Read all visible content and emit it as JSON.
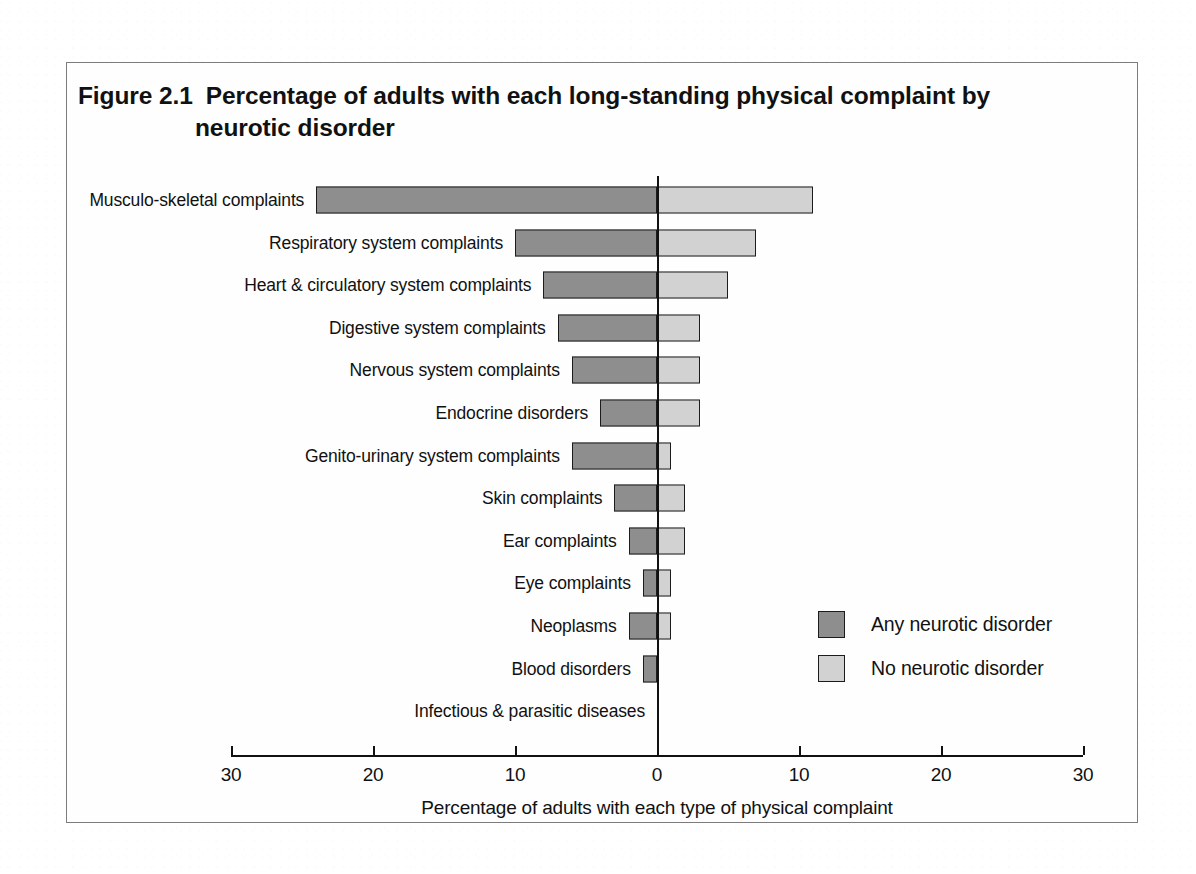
{
  "figure": {
    "number": "Figure 2.1",
    "title_line1": "Percentage of adults with each long-standing physical complaint by",
    "title_line2": "neurotic disorder"
  },
  "legend": {
    "items": [
      {
        "label": "Any neurotic disorder",
        "color": "#8e8e8e"
      },
      {
        "label": "No neurotic disorder",
        "color": "#d2d2d2"
      }
    ]
  },
  "chart_data": {
    "type": "bar",
    "orientation": "horizontal",
    "layout": "diverging-bidirectional",
    "xlabel": "Percentage of adults with each type of physical complaint",
    "ylabel": "",
    "xlim": [
      -30,
      30
    ],
    "xticks": [
      -30,
      -20,
      -10,
      0,
      10,
      20,
      30
    ],
    "xticklabels": [
      "30",
      "20",
      "10",
      "0",
      "10",
      "20",
      "30"
    ],
    "grid": false,
    "legend_position": "middle-right",
    "categories": [
      "Musculo-skeletal complaints",
      "Respiratory system complaints",
      "Heart & circulatory system complaints",
      "Digestive system complaints",
      "Nervous system complaints",
      "Endocrine disorders",
      "Genito-urinary system complaints",
      "Skin complaints",
      "Ear complaints",
      "Eye complaints",
      "Neoplasms",
      "Blood disorders",
      "Infectious & parasitic diseases"
    ],
    "series": [
      {
        "name": "Any neurotic disorder",
        "direction": "left",
        "color": "#8e8e8e",
        "values": [
          24,
          10,
          8,
          7,
          6,
          4,
          6,
          3,
          2,
          1,
          2,
          1,
          0
        ]
      },
      {
        "name": "No neurotic disorder",
        "direction": "right",
        "color": "#d2d2d2",
        "values": [
          11,
          7,
          5,
          3,
          3,
          3,
          1,
          2,
          2,
          1,
          1,
          0,
          0
        ]
      }
    ]
  }
}
